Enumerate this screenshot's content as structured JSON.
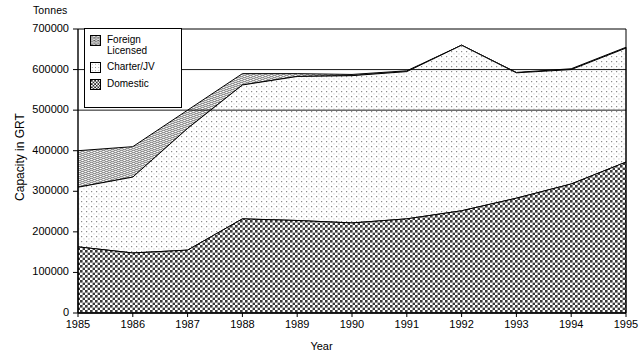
{
  "chart_data": {
    "type": "area",
    "title": "",
    "unit_note": "Tonnes",
    "xlabel": "Year",
    "ylabel": "Capacity in GRT",
    "stacked": true,
    "grid": false,
    "legend_position": "top-left-inside",
    "categories": [
      "1985",
      "1986",
      "1987",
      "1988",
      "1989",
      "1990",
      "1991",
      "1992",
      "1993",
      "1994",
      "1995"
    ],
    "xlim": [
      1985,
      1995
    ],
    "ylim": [
      0,
      700000
    ],
    "ytick_values": [
      0,
      100000,
      200000,
      300000,
      400000,
      500000,
      600000,
      700000
    ],
    "ytick_labels": [
      "0",
      "100000",
      "200000",
      "300000",
      "400000",
      "500000",
      "600000",
      "700000"
    ],
    "xtick_labels": [
      "1985",
      "1986",
      "1987",
      "1988",
      "1989",
      "1990",
      "1991",
      "1992",
      "1993",
      "1994",
      "1995"
    ],
    "series": [
      {
        "name": "Domestic",
        "values": [
          163000,
          148000,
          155000,
          232000,
          228000,
          222000,
          232000,
          252000,
          283000,
          318000,
          372000
        ]
      },
      {
        "name": "Charter/JV",
        "values": [
          147000,
          187000,
          300000,
          330000,
          355000,
          363000,
          363000,
          408000,
          309000,
          282000,
          281000
        ]
      },
      {
        "name": "Foreign Licensed",
        "values": [
          90000,
          75000,
          45000,
          28000,
          7000,
          3000,
          2000,
          0,
          1000,
          2000,
          2000
        ]
      }
    ],
    "cumulative_tops": {
      "Domestic": [
        163000,
        148000,
        155000,
        232000,
        228000,
        222000,
        232000,
        252000,
        283000,
        318000,
        372000
      ],
      "Charter/JV": [
        310000,
        335000,
        455000,
        562000,
        583000,
        585000,
        595000,
        660000,
        592000,
        600000,
        653000
      ],
      "Foreign Licensed": [
        400000,
        410000,
        500000,
        590000,
        590000,
        588000,
        597000,
        660000,
        593000,
        602000,
        655000
      ]
    }
  },
  "legend": {
    "items": [
      {
        "label": "Foreign\nLicensed",
        "pattern": "wavy-dense"
      },
      {
        "label": "Charter/JV",
        "pattern": "light-dots"
      },
      {
        "label": "Domestic",
        "pattern": "dark-checker"
      }
    ]
  },
  "colors": {
    "axis": "#000000",
    "domestic": "#585858",
    "charter": "#f2f2f2",
    "foreign": "#bdbdbd",
    "background": "#ffffff"
  }
}
